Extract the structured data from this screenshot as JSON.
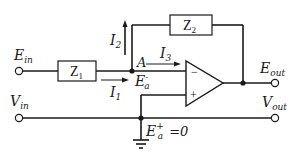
{
  "diagram": {
    "components": {
      "z1": {
        "label": "Z",
        "sub": "1"
      },
      "z2": {
        "label": "Z",
        "sub": "2"
      },
      "opamp": {
        "minus": "−",
        "plus": "+"
      }
    },
    "terminals": {
      "ein": {
        "main": "E",
        "sub": "in"
      },
      "vin": {
        "main": "V",
        "sub": "in"
      },
      "eout": {
        "main": "E",
        "sub": "out"
      },
      "vout": {
        "main": "V",
        "sub": "out"
      }
    },
    "currents": {
      "i1": {
        "main": "I",
        "sub": "1"
      },
      "i2": {
        "main": "I",
        "sub": "2"
      },
      "i3": {
        "main": "I",
        "sub": "3"
      }
    },
    "nodes": {
      "a": "A",
      "ea_minus": {
        "main": "E",
        "sub": "a",
        "sup": "-"
      },
      "ea_plus": {
        "main": "E",
        "sub": "a",
        "sup": "+",
        "value": "=0"
      }
    },
    "colors": {
      "line": "#1a1a1a",
      "background": "#ffffff"
    }
  }
}
